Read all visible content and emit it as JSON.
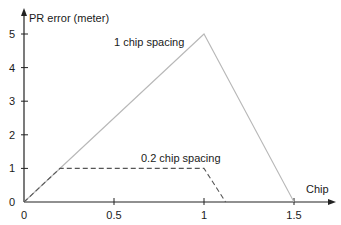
{
  "chart_data": {
    "type": "line",
    "title": "",
    "xlabel": "Chip",
    "ylabel": "PR error (meter)",
    "xlim": [
      0,
      1.7
    ],
    "ylim": [
      0,
      5.5
    ],
    "xticks": [
      0,
      0.5,
      1,
      1.5
    ],
    "xtick_labels": [
      "0",
      "0.5",
      "1",
      "1.5"
    ],
    "yticks": [
      0,
      1,
      2,
      3,
      4,
      5
    ],
    "ytick_labels": [
      "0",
      "1",
      "2",
      "3",
      "4",
      "5"
    ],
    "grid": false,
    "legend": null,
    "series": [
      {
        "name": "1 chip spacing",
        "style": "solid",
        "color": "#b8b8b8",
        "x": [
          0,
          1,
          1.5
        ],
        "y": [
          0,
          5,
          0
        ]
      },
      {
        "name": "0.2 chip spacing",
        "style": "dashed",
        "color": "#555555",
        "x": [
          0,
          0.2,
          1.0,
          1.12
        ],
        "y": [
          0,
          1,
          1,
          0
        ]
      }
    ],
    "annotations": [
      {
        "text": "1 chip spacing",
        "x": 0.5,
        "y": 4.75
      },
      {
        "text": "0.2 chip spacing",
        "x": 0.65,
        "y": 1.3
      }
    ]
  }
}
